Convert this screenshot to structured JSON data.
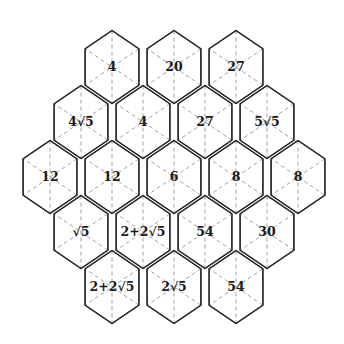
{
  "diagram": {
    "title": "",
    "shape": "hexagonal grid of hexagons (rows 3-4-5-4-3)",
    "colors": {
      "stroke": "#2a2a2a",
      "dash": "#8a8a8a",
      "text": "#1a1a1a",
      "background": "#ffffff"
    },
    "rows": [
      {
        "cells": [
          {
            "label": "4"
          },
          {
            "label": "20"
          },
          {
            "label": "27"
          }
        ]
      },
      {
        "cells": [
          {
            "label": "4√5"
          },
          {
            "label": "4"
          },
          {
            "label": "27"
          },
          {
            "label": "5√5"
          }
        ]
      },
      {
        "cells": [
          {
            "label": "12"
          },
          {
            "label": "12"
          },
          {
            "label": "6"
          },
          {
            "label": "8"
          },
          {
            "label": "8"
          }
        ]
      },
      {
        "cells": [
          {
            "label": "√5"
          },
          {
            "label": "2+2√5"
          },
          {
            "label": "54"
          },
          {
            "label": "30"
          }
        ]
      },
      {
        "cells": [
          {
            "label": "2+2√5"
          },
          {
            "label": "2√5"
          },
          {
            "label": "54"
          }
        ]
      }
    ]
  }
}
